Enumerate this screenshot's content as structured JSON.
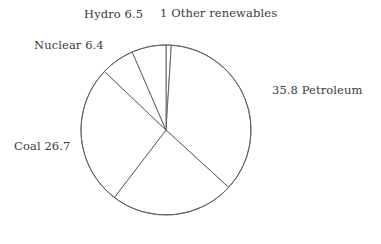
{
  "chart_data": {
    "type": "pie",
    "title": "",
    "subtitle": "",
    "xlabel": "",
    "ylabel": "",
    "legend_position": "outside-labels",
    "grid": false,
    "units": "percent",
    "total": 100,
    "start_angle_deg": 0,
    "direction": "clockwise",
    "center": {
      "x": 166,
      "y": 130
    },
    "radius": 85,
    "categories": [
      "Other renewables",
      "Petroleum",
      "Natural gas",
      "Coal",
      "Nuclear",
      "Hydro"
    ],
    "values": [
      1,
      35.8,
      23.6,
      26.7,
      6.4,
      6.5
    ],
    "slices": [
      {
        "name": "Other renewables",
        "value": 1,
        "label_text": "1 Other renewables",
        "label_visible": true,
        "start_deg": 0,
        "end_deg": 3.6
      },
      {
        "name": "Petroleum",
        "value": 35.8,
        "label_text": "35.8 Petroleum",
        "label_visible": true,
        "start_deg": 3.6,
        "end_deg": 132.48
      },
      {
        "name": "Natural gas",
        "value": 23.6,
        "label_text": "",
        "label_visible": false,
        "start_deg": 132.48,
        "end_deg": 217.44
      },
      {
        "name": "Coal",
        "value": 26.7,
        "label_text": "Coal 26.7",
        "label_visible": true,
        "start_deg": 217.44,
        "end_deg": 313.56
      },
      {
        "name": "Nuclear",
        "value": 6.4,
        "label_text": "Nuclear 6.4",
        "label_visible": true,
        "start_deg": 313.56,
        "end_deg": 336.6
      },
      {
        "name": "Hydro",
        "value": 6.5,
        "label_text": "Hydro 6.5",
        "label_visible": true,
        "start_deg": 336.6,
        "end_deg": 360
      }
    ]
  },
  "labels": {
    "hydro": "Hydro 6.5",
    "other_renewables": "1 Other renewables",
    "nuclear": "Nuclear 6.4",
    "petroleum": "35.8 Petroleum",
    "coal": "Coal 26.7"
  },
  "colors": {
    "background": "#ffffff",
    "slice_fill": "#ffffff",
    "stroke": "#5a5a5a",
    "text": "#3b3b3b"
  }
}
